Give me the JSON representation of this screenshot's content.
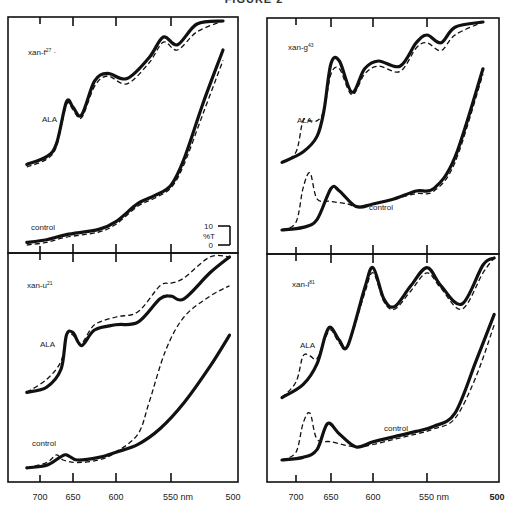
{
  "figure_title": "FIGURE 2",
  "chart_data": [
    {
      "type": "line",
      "panel": "top-left",
      "title": "xan-f27",
      "xlabel": "nm",
      "x_ticks": [
        700,
        650,
        600,
        550,
        500
      ],
      "ylabel": "%T",
      "scale_bar": {
        "label": "%T",
        "low": "0",
        "high": "10"
      },
      "series": [
        {
          "name": "ALA",
          "style": "solid",
          "points": [
            [
              720,
              6
            ],
            [
              690,
              9
            ],
            [
              675,
              14
            ],
            [
              660,
              30
            ],
            [
              650,
              28
            ],
            [
              640,
              25
            ],
            [
              625,
              38
            ],
            [
              610,
              41
            ],
            [
              590,
              39
            ],
            [
              570,
              47
            ],
            [
              557,
              55
            ],
            [
              545,
              52
            ],
            [
              530,
              60
            ],
            [
              510,
              70
            ]
          ]
        },
        {
          "name": "ALA",
          "style": "dashed",
          "points": [
            [
              720,
              5
            ],
            [
              690,
              8
            ],
            [
              675,
              13
            ],
            [
              660,
              29
            ],
            [
              650,
              27
            ],
            [
              640,
              24
            ],
            [
              625,
              36
            ],
            [
              610,
              40
            ],
            [
              590,
              37
            ],
            [
              570,
              45
            ],
            [
              557,
              53
            ],
            [
              545,
              50
            ],
            [
              530,
              57
            ],
            [
              510,
              66
            ]
          ]
        },
        {
          "name": "control",
          "style": "solid",
          "points": [
            [
              720,
              -24
            ],
            [
              690,
              -23
            ],
            [
              660,
              -21
            ],
            [
              620,
              -19
            ],
            [
              600,
              -16
            ],
            [
              580,
              -9
            ],
            [
              565,
              -6
            ],
            [
              550,
              -2
            ],
            [
              540,
              8
            ],
            [
              525,
              30
            ],
            [
              510,
              50
            ]
          ]
        },
        {
          "name": "control",
          "style": "dashed",
          "points": [
            [
              720,
              -25
            ],
            [
              690,
              -24
            ],
            [
              660,
              -22
            ],
            [
              620,
              -20
            ],
            [
              600,
              -17
            ],
            [
              580,
              -10
            ],
            [
              565,
              -7
            ],
            [
              550,
              -3
            ],
            [
              540,
              6
            ],
            [
              525,
              26
            ],
            [
              510,
              46
            ]
          ]
        }
      ],
      "annotations": [
        "ALA",
        "control"
      ]
    },
    {
      "type": "line",
      "panel": "top-right",
      "title": "xan-g43",
      "xlabel": "nm",
      "x_ticks": [
        700,
        650,
        600,
        550,
        500
      ],
      "series": [
        {
          "name": "ALA",
          "style": "solid",
          "points": [
            [
              720,
              6
            ],
            [
              690,
              10
            ],
            [
              670,
              16
            ],
            [
              660,
              26
            ],
            [
              650,
              44
            ],
            [
              640,
              45
            ],
            [
              625,
              33
            ],
            [
              610,
              42
            ],
            [
              595,
              45
            ],
            [
              575,
              43
            ],
            [
              560,
              52
            ],
            [
              550,
              55
            ],
            [
              540,
              52
            ],
            [
              530,
              58
            ],
            [
              510,
              72
            ]
          ]
        },
        {
          "name": "ALA",
          "style": "dashed",
          "points": [
            [
              720,
              6
            ],
            [
              700,
              10
            ],
            [
              690,
              22
            ],
            [
              680,
              22
            ],
            [
              670,
              22
            ],
            [
              660,
              26
            ],
            [
              650,
              40
            ],
            [
              640,
              42
            ],
            [
              625,
              32
            ],
            [
              610,
              40
            ],
            [
              595,
              43
            ],
            [
              575,
              41
            ],
            [
              560,
              50
            ],
            [
              550,
              52
            ],
            [
              540,
              49
            ],
            [
              530,
              55
            ],
            [
              510,
              70
            ]
          ]
        },
        {
          "name": "control",
          "style": "solid",
          "points": [
            [
              720,
              -20
            ],
            [
              690,
              -19
            ],
            [
              670,
              -16
            ],
            [
              650,
              -4
            ],
            [
              640,
              -5
            ],
            [
              620,
              -11
            ],
            [
              600,
              -10
            ],
            [
              580,
              -8
            ],
            [
              560,
              -5
            ],
            [
              545,
              -4
            ],
            [
              530,
              8
            ],
            [
              510,
              42
            ]
          ]
        },
        {
          "name": "control",
          "style": "dashed",
          "points": [
            [
              720,
              -20
            ],
            [
              700,
              -17
            ],
            [
              690,
              -4
            ],
            [
              680,
              2
            ],
            [
              670,
              -8
            ],
            [
              650,
              -9
            ],
            [
              630,
              -10
            ],
            [
              620,
              -11
            ],
            [
              600,
              -10
            ],
            [
              580,
              -8
            ],
            [
              560,
              -6
            ],
            [
              545,
              -5
            ],
            [
              530,
              6
            ],
            [
              510,
              40
            ]
          ]
        }
      ],
      "annotations": [
        "ALA",
        "control"
      ]
    },
    {
      "type": "line",
      "panel": "bottom-left",
      "title": "xan-u21",
      "xlabel": "nm",
      "x_ticks": [
        700,
        650,
        600,
        550,
        500
      ],
      "series": [
        {
          "name": "ALA",
          "style": "solid",
          "points": [
            [
              720,
              6
            ],
            [
              690,
              8
            ],
            [
              668,
              15
            ],
            [
              660,
              28
            ],
            [
              650,
              29
            ],
            [
              640,
              24
            ],
            [
              625,
              30
            ],
            [
              600,
              32
            ],
            [
              580,
              33
            ],
            [
              560,
              42
            ],
            [
              550,
              43
            ],
            [
              540,
              42
            ],
            [
              520,
              52
            ],
            [
              505,
              60
            ]
          ]
        },
        {
          "name": "ALA",
          "style": "dashed",
          "points": [
            [
              720,
              6
            ],
            [
              690,
              11
            ],
            [
              668,
              18
            ],
            [
              660,
              28
            ],
            [
              650,
              28
            ],
            [
              640,
              25
            ],
            [
              625,
              32
            ],
            [
              600,
              35
            ],
            [
              580,
              37
            ],
            [
              560,
              47
            ],
            [
              550,
              48
            ],
            [
              540,
              50
            ],
            [
              520,
              60
            ],
            [
              505,
              67
            ]
          ]
        },
        {
          "name": "control",
          "style": "solid",
          "points": [
            [
              720,
              -23
            ],
            [
              690,
              -22
            ],
            [
              670,
              -19
            ],
            [
              660,
              -18
            ],
            [
              645,
              -20
            ],
            [
              620,
              -19
            ],
            [
              600,
              -17
            ],
            [
              580,
              -14
            ],
            [
              560,
              -8
            ],
            [
              540,
              2
            ],
            [
              520,
              16
            ],
            [
              505,
              28
            ]
          ]
        },
        {
          "name": "control",
          "style": "dashed",
          "points": [
            [
              720,
              -23
            ],
            [
              690,
              -21
            ],
            [
              675,
              -18
            ],
            [
              665,
              -20
            ],
            [
              645,
              -21
            ],
            [
              620,
              -20
            ],
            [
              600,
              -17
            ],
            [
              580,
              -10
            ],
            [
              570,
              2
            ],
            [
              555,
              22
            ],
            [
              540,
              35
            ],
            [
              520,
              43
            ],
            [
              505,
              47
            ]
          ]
        }
      ],
      "annotations": [
        "ALA",
        "control"
      ]
    },
    {
      "type": "line",
      "panel": "bottom-right",
      "title": "xan-l81",
      "xlabel": "nm",
      "x_ticks": [
        700,
        650,
        600,
        550,
        500
      ],
      "series": [
        {
          "name": "ALA",
          "style": "solid",
          "points": [
            [
              720,
              4
            ],
            [
              690,
              9
            ],
            [
              670,
              17
            ],
            [
              658,
              28
            ],
            [
              650,
              31
            ],
            [
              640,
              26
            ],
            [
              630,
              24
            ],
            [
              610,
              46
            ],
            [
              600,
              54
            ],
            [
              590,
              42
            ],
            [
              580,
              39
            ],
            [
              565,
              47
            ],
            [
              550,
              54
            ],
            [
              540,
              47
            ],
            [
              525,
              40
            ],
            [
              510,
              55
            ],
            [
              502,
              67
            ]
          ]
        },
        {
          "name": "ALA",
          "style": "dashed",
          "points": [
            [
              720,
              4
            ],
            [
              700,
              10
            ],
            [
              690,
              20
            ],
            [
              680,
              20
            ],
            [
              670,
              19
            ],
            [
              658,
              27
            ],
            [
              650,
              30
            ],
            [
              640,
              25
            ],
            [
              630,
              24
            ],
            [
              610,
              44
            ],
            [
              600,
              52
            ],
            [
              590,
              41
            ],
            [
              580,
              38
            ],
            [
              565,
              45
            ],
            [
              550,
              52
            ],
            [
              540,
              46
            ],
            [
              525,
              38
            ],
            [
              510,
              52
            ],
            [
              502,
              64
            ]
          ]
        },
        {
          "name": "control",
          "style": "solid",
          "points": [
            [
              720,
              -20
            ],
            [
              690,
              -19
            ],
            [
              670,
              -16
            ],
            [
              655,
              -6
            ],
            [
              640,
              -10
            ],
            [
              620,
              -15
            ],
            [
              600,
              -13
            ],
            [
              580,
              -11
            ],
            [
              560,
              -9
            ],
            [
              545,
              -7
            ],
            [
              530,
              -2
            ],
            [
              515,
              18
            ],
            [
              502,
              36
            ]
          ]
        },
        {
          "name": "control",
          "style": "dashed",
          "points": [
            [
              720,
              -20
            ],
            [
              700,
              -17
            ],
            [
              690,
              -6
            ],
            [
              680,
              -2
            ],
            [
              670,
              -12
            ],
            [
              650,
              -13
            ],
            [
              620,
              -15
            ],
            [
              600,
              -14
            ],
            [
              580,
              -12
            ],
            [
              560,
              -10
            ],
            [
              545,
              -8
            ],
            [
              530,
              -4
            ],
            [
              515,
              12
            ],
            [
              502,
              32
            ]
          ]
        }
      ],
      "annotations": [
        "ALA",
        "control"
      ]
    }
  ],
  "panels": [
    {
      "title_base": "xan-f",
      "title_sup": "27",
      "title_suffix": " ·",
      "ala_label": "ALA",
      "control_label": "control"
    },
    {
      "title_base": "xan-g",
      "title_sup": "43",
      "title_suffix": "",
      "ala_label": "ALA",
      "control_label": "control"
    },
    {
      "title_base": "xan-u",
      "title_sup": "21",
      "title_suffix": "",
      "ala_label": "ALA",
      "control_label": "control"
    },
    {
      "title_base": "xan-l",
      "title_sup": "81",
      "title_suffix": "",
      "ala_label": "ALA",
      "control_label": "control"
    }
  ],
  "x_axis": {
    "labels": [
      "700",
      "650",
      "600",
      "550 nm",
      "500"
    ]
  },
  "scale_bar": {
    "high": "10",
    "low": "0",
    "unit": "%T"
  }
}
